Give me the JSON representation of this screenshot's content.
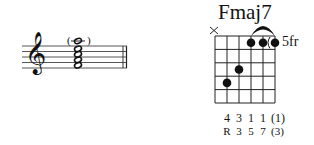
{
  "chord": {
    "name": "Fmaj7",
    "fret_position_label": "5fr",
    "muted_marker": "×",
    "strings_low_to_high": [
      {
        "string": 6,
        "state": "muted",
        "finger": "",
        "tone": ""
      },
      {
        "string": 5,
        "state": "fretted",
        "fret": 4,
        "finger": "4",
        "tone": "R"
      },
      {
        "string": 4,
        "state": "fretted",
        "fret": 3,
        "finger": "3",
        "tone": "3"
      },
      {
        "string": 3,
        "state": "fretted",
        "fret": 1,
        "finger": "1",
        "tone": "5"
      },
      {
        "string": 2,
        "state": "fretted",
        "fret": 1,
        "finger": "1",
        "tone": "7"
      },
      {
        "string": 1,
        "state": "optional",
        "fret": 1,
        "finger": "(1)",
        "tone": "(3)"
      }
    ],
    "barre": {
      "fret": 1,
      "from_string": 3,
      "to_string": 1
    },
    "fingers": [
      "4",
      "3",
      "1",
      "1",
      "(1)"
    ],
    "tones": [
      "R",
      "3",
      "5",
      "7",
      "(3)"
    ]
  },
  "notation": {
    "clef": "treble",
    "clef_glyph": "𝄞",
    "chord_notes": "stacked whole notes, top note in parentheses",
    "optional_note_parens": [
      "(",
      ")"
    ],
    "barline": "final double barline"
  }
}
